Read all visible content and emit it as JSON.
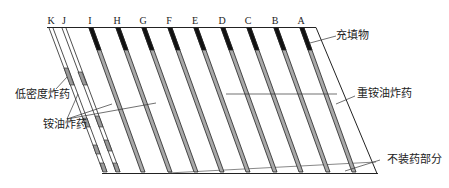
{
  "diagram": {
    "type": "blast-hole layout cross-section",
    "hole_labels": [
      "K",
      "J",
      "I",
      "H",
      "G",
      "F",
      "E",
      "D",
      "C",
      "B",
      "A"
    ],
    "annotations": {
      "stemming": "充填物",
      "heavy_anfo": "重铵油炸药",
      "low_density": "低密度炸药",
      "anfo": "铵油炸药",
      "uncharged": "不装药部分"
    },
    "colors": {
      "line": "#222222",
      "stemming_fill": "#111111",
      "explosive_fill": "#a8a8a8",
      "low_density_fill": "#9a9a9a",
      "background": "#ffffff"
    }
  }
}
